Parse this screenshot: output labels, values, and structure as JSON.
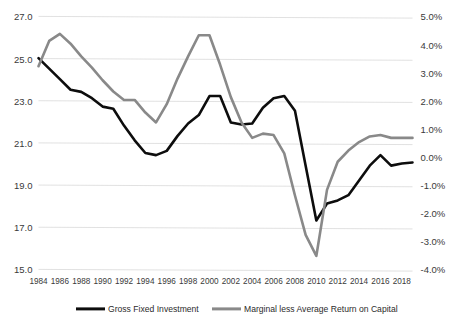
{
  "chart_data": {
    "type": "line",
    "title": "",
    "subtitle": "",
    "xlabel": "",
    "ylabel": "",
    "grid": true,
    "legend_position": "bottom",
    "x": [
      1984,
      1985,
      1986,
      1987,
      1988,
      1989,
      1990,
      1991,
      1992,
      1993,
      1994,
      1995,
      1996,
      1997,
      1998,
      1999,
      2000,
      2001,
      2002,
      2003,
      2004,
      2005,
      2006,
      2007,
      2008,
      2009,
      2010,
      2011,
      2012,
      2013,
      2014,
      2015,
      2016,
      2017,
      2018,
      2019
    ],
    "x_tick_labels": [
      "1984",
      "1986",
      "1988",
      "1990",
      "1992",
      "1994",
      "1996",
      "1998",
      "2000",
      "2002",
      "2004",
      "2006",
      "2008",
      "2010",
      "2012",
      "2014",
      "2016",
      "2018"
    ],
    "axes": [
      {
        "id": "left",
        "name": "Gross Fixed Investment",
        "ylim": [
          15.0,
          27.0
        ],
        "ticks": [
          15.0,
          17.0,
          19.0,
          21.0,
          23.0,
          25.0,
          27.0
        ],
        "tick_labels": [
          "15.0",
          "17.0",
          "19.0",
          "21.0",
          "23.0",
          "25.0",
          "27.0"
        ]
      },
      {
        "id": "right",
        "name": "Marginal less Average Return on Capital",
        "ylim": [
          -4.0,
          5.0
        ],
        "ticks": [
          -4.0,
          -3.0,
          -2.0,
          -1.0,
          0.0,
          1.0,
          2.0,
          3.0,
          4.0,
          5.0
        ],
        "tick_labels": [
          "-4.0%",
          "-3.0%",
          "-2.0%",
          "-1.0%",
          "0.0%",
          "1.0%",
          "2.0%",
          "3.0%",
          "4.0%",
          "5.0%"
        ]
      }
    ],
    "series": [
      {
        "name": "Gross Fixed Investment",
        "axis": "left",
        "color": "#0d0d0d",
        "width": 2.6,
        "values": [
          25.05,
          24.55,
          24.05,
          23.55,
          23.45,
          23.15,
          22.75,
          22.65,
          21.85,
          21.15,
          20.55,
          20.45,
          20.65,
          21.35,
          21.95,
          22.35,
          23.25,
          23.25,
          22.0,
          21.9,
          21.95,
          22.7,
          23.15,
          23.25,
          22.55,
          19.95,
          17.35,
          18.15,
          18.3,
          18.55,
          19.25,
          19.95,
          20.45,
          19.95,
          20.05,
          20.1
        ]
      },
      {
        "name": "Marginal less Average Return on Capital",
        "axis": "right",
        "color": "#898989",
        "width": 2.6,
        "values": [
          3.25,
          4.15,
          4.4,
          4.05,
          3.6,
          3.2,
          2.75,
          2.35,
          2.05,
          2.05,
          1.6,
          1.25,
          1.9,
          2.8,
          3.6,
          4.35,
          4.35,
          3.3,
          2.15,
          1.25,
          0.7,
          0.85,
          0.8,
          0.15,
          -1.35,
          -2.75,
          -3.5,
          -1.15,
          -0.15,
          0.25,
          0.55,
          0.75,
          0.8,
          0.7,
          0.7,
          0.7
        ]
      }
    ]
  },
  "legend": {
    "items": [
      {
        "label": "Gross Fixed Investment",
        "color": "#0d0d0d"
      },
      {
        "label": "Marginal less Average Return on Capital",
        "color": "#898989"
      }
    ]
  }
}
